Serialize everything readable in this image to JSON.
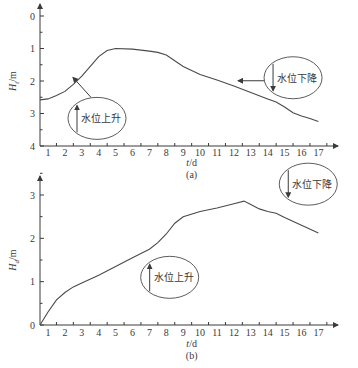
{
  "chart_data": [
    {
      "id": "a",
      "type": "line",
      "caption": "(a)",
      "xlabel": "t/d",
      "ylabel": "H_t/m",
      "ylabel_main": "H",
      "ylabel_sub": "t",
      "ylabel_unit": "/m",
      "y_inverted": true,
      "ylim": [
        0,
        4
      ],
      "xlim": [
        0.5,
        18
      ],
      "x_ticks": [
        1,
        2,
        3,
        4,
        5,
        6,
        7,
        8,
        9,
        10,
        11,
        12,
        13,
        14,
        15,
        16,
        17
      ],
      "y_ticks": [
        0,
        1,
        2,
        3,
        4
      ],
      "series": [
        {
          "name": "water level",
          "x": [
            0.5,
            1.0,
            1.5,
            2.0,
            2.5,
            3.0,
            3.5,
            4.0,
            4.5,
            5.0,
            6.0,
            7.0,
            7.5,
            8.0,
            9.0,
            10.0,
            11.0,
            12.0,
            13.0,
            14.0,
            14.5,
            15.0,
            15.5,
            16.0,
            16.5,
            17.0
          ],
          "y": [
            2.58,
            2.55,
            2.45,
            2.32,
            2.1,
            1.85,
            1.55,
            1.25,
            1.06,
            1.0,
            1.02,
            1.08,
            1.12,
            1.2,
            1.55,
            1.8,
            1.97,
            2.15,
            2.35,
            2.55,
            2.65,
            2.8,
            2.98,
            3.08,
            3.15,
            3.25
          ]
        }
      ],
      "annotations": [
        {
          "text": "水位上升",
          "arrow": "up",
          "ellipse_cx": 3.9,
          "ellipse_cy": 3.15
        },
        {
          "text": "水位下降",
          "arrow": "down",
          "ellipse_cx": 15.5,
          "ellipse_cy": 1.9
        }
      ]
    },
    {
      "id": "b",
      "type": "line",
      "caption": "(b)",
      "xlabel": "t/d",
      "ylabel": "H_d/m",
      "ylabel_main": "H",
      "ylabel_sub": "d",
      "ylabel_unit": "/m",
      "y_inverted": false,
      "ylim": [
        0,
        3.5
      ],
      "xlim": [
        0.5,
        18
      ],
      "x_ticks": [
        1,
        2,
        3,
        4,
        5,
        6,
        7,
        8,
        9,
        10,
        11,
        12,
        13,
        14,
        15,
        16,
        17
      ],
      "y_ticks": [
        0,
        1,
        2,
        3
      ],
      "series": [
        {
          "name": "water level",
          "x": [
            0.5,
            1.0,
            1.5,
            2.0,
            2.5,
            3.0,
            4.0,
            5.0,
            6.0,
            6.5,
            7.0,
            7.5,
            8.0,
            8.5,
            9.0,
            10.0,
            11.0,
            12.0,
            12.6,
            13.0,
            13.5,
            14.0,
            14.5,
            15.0,
            16.0,
            17.0
          ],
          "y": [
            0.0,
            0.3,
            0.58,
            0.75,
            0.88,
            0.97,
            1.15,
            1.35,
            1.55,
            1.65,
            1.75,
            1.9,
            2.1,
            2.35,
            2.5,
            2.62,
            2.7,
            2.8,
            2.86,
            2.78,
            2.68,
            2.62,
            2.58,
            2.48,
            2.3,
            2.12
          ]
        }
      ],
      "annotations": [
        {
          "text": "水位上升",
          "arrow": "up",
          "ellipse_cx": 8.2,
          "ellipse_cy": 1.1
        },
        {
          "text": "水位下降",
          "arrow": "down",
          "ellipse_cx": 16.4,
          "ellipse_cy": 3.25
        }
      ]
    }
  ],
  "labels": {
    "a_caption": "(a)",
    "b_caption": "(b)",
    "xlabel": "t/d",
    "rise": "水位上升",
    "fall": "水位下降"
  }
}
